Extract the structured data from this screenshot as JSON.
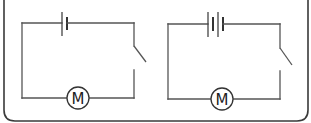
{
  "figure": {
    "colors": {
      "line": "#555555",
      "frame": "#3a3a3a",
      "background": "#ffffff"
    }
  },
  "circuits": [
    {
      "id": "circuit-1",
      "battery": {
        "cells": 1
      },
      "switch": {
        "state": "open"
      },
      "motor": {
        "label": "M"
      }
    },
    {
      "id": "circuit-2",
      "battery": {
        "cells": 2
      },
      "switch": {
        "state": "open"
      },
      "motor": {
        "label": "M"
      }
    }
  ]
}
